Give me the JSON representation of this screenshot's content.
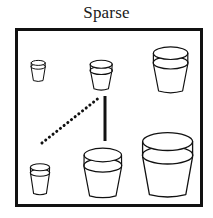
{
  "figure": {
    "title": "Sparse",
    "background_color": "#ffffff",
    "ink_color": "#111111"
  },
  "frame": {
    "name": "scene-border",
    "x": 15,
    "y": 28,
    "width": 188,
    "height": 179,
    "border_width": 3,
    "border_color": "#111111"
  },
  "objects": [
    {
      "id": "pot-top-left-small",
      "label": "flower pot",
      "size_class": "small",
      "x": 30,
      "y": 61,
      "width": 16,
      "height": 21
    },
    {
      "id": "pot-top-middle",
      "label": "flower pot",
      "size_class": "medium",
      "x": 88,
      "y": 58,
      "width": 26,
      "height": 33
    },
    {
      "id": "pot-top-right-large",
      "label": "flower pot",
      "size_class": "large",
      "x": 150,
      "y": 44,
      "width": 41,
      "height": 50
    },
    {
      "id": "pot-bottom-left-small",
      "label": "flower pot",
      "size_class": "small",
      "x": 28,
      "y": 162,
      "width": 24,
      "height": 34
    },
    {
      "id": "pot-bottom-middle-large",
      "label": "flower pot",
      "size_class": "large",
      "x": 80,
      "y": 145,
      "width": 46,
      "height": 53
    },
    {
      "id": "pot-bottom-right-xlarge",
      "label": "flower pot",
      "size_class": "x-large",
      "x": 138,
      "y": 131,
      "width": 59,
      "height": 66
    }
  ],
  "annotations": [
    {
      "id": "dotted-diagonal",
      "style": "dotted",
      "x1": 42,
      "y1": 143,
      "x2": 100,
      "y2": 97,
      "thickness": 3,
      "color": "#111111"
    },
    {
      "id": "solid-vertical",
      "style": "solid",
      "x1": 105,
      "y1": 96,
      "x2": 105,
      "y2": 141,
      "thickness": 3,
      "color": "#111111"
    }
  ]
}
